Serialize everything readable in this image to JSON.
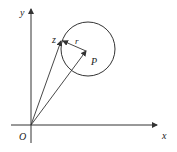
{
  "diagram": {
    "labels": {
      "y_axis": "y",
      "x_axis": "x",
      "origin": "O",
      "point_z": "z",
      "center": "P",
      "radius": "r"
    },
    "colors": {
      "stroke": "#333333",
      "text": "#222222"
    }
  }
}
